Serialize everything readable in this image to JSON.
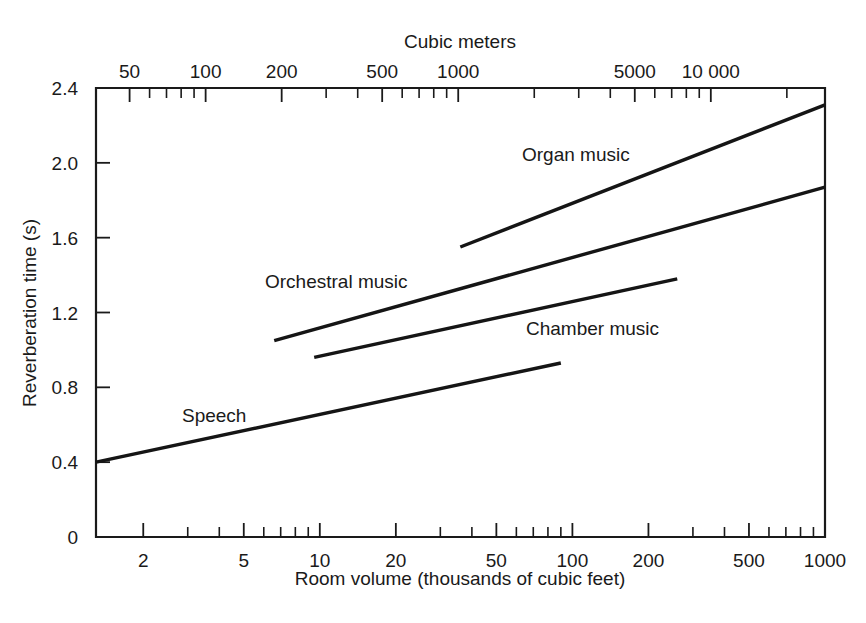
{
  "chart_data": {
    "type": "line",
    "title": "",
    "xlabel": "Room volume (thousands of cubic feet)",
    "ylabel": "Reverberation time (s)",
    "top_axis_label": "Cubic meters",
    "x_scale": "log",
    "y_scale": "linear",
    "xlim": [
      1.3,
      1000
    ],
    "ylim": [
      0,
      2.4
    ],
    "grid": false,
    "legend_position": "inline-labels",
    "x_ticks_major": [
      {
        "value": 2,
        "label": "2"
      },
      {
        "value": 5,
        "label": "5"
      },
      {
        "value": 10,
        "label": "10"
      },
      {
        "value": 20,
        "label": "20"
      },
      {
        "value": 50,
        "label": "50"
      },
      {
        "value": 100,
        "label": "100"
      },
      {
        "value": 200,
        "label": "200"
      },
      {
        "value": 500,
        "label": "500"
      },
      {
        "value": 1000,
        "label": "1000"
      }
    ],
    "x_ticks_minor": [
      3,
      4,
      6,
      7,
      8,
      9,
      30,
      40,
      60,
      70,
      80,
      90,
      300,
      400,
      600,
      700,
      800,
      900
    ],
    "top_ticks_major": [
      {
        "value": 50,
        "label": "50"
      },
      {
        "value": 100,
        "label": "100"
      },
      {
        "value": 200,
        "label": "200"
      },
      {
        "value": 500,
        "label": "500"
      },
      {
        "value": 1000,
        "label": "1000"
      },
      {
        "value": 5000,
        "label": "5000"
      },
      {
        "value": 10000,
        "label": "10 000"
      }
    ],
    "y_ticks": [
      {
        "value": 0,
        "label": "0"
      },
      {
        "value": 0.4,
        "label": "0.4"
      },
      {
        "value": 0.8,
        "label": "0.8"
      },
      {
        "value": 1.2,
        "label": "1.2"
      },
      {
        "value": 1.6,
        "label": "1.6"
      },
      {
        "value": 2.0,
        "label": "2.0"
      },
      {
        "value": 2.4,
        "label": "2.4"
      }
    ],
    "series": [
      {
        "name": "Speech",
        "label": "Speech",
        "points": [
          [
            1.3,
            0.4
          ],
          [
            90,
            0.93
          ]
        ]
      },
      {
        "name": "Chamber music",
        "label": "Chamber music",
        "points": [
          [
            9.5,
            0.96
          ],
          [
            260,
            1.38
          ]
        ]
      },
      {
        "name": "Orchestral music",
        "label": "Orchestral music",
        "points": [
          [
            6.6,
            1.05
          ],
          [
            1000,
            1.87
          ]
        ]
      },
      {
        "name": "Organ music",
        "label": "Organ music",
        "points": [
          [
            36,
            1.55
          ],
          [
            1000,
            2.31
          ]
        ]
      }
    ]
  },
  "series_label_positions": {
    "speech": {
      "x": 182,
      "y": 422
    },
    "orchestral": {
      "x": 265,
      "y": 288
    },
    "chamber": {
      "x": 526,
      "y": 335
    },
    "organ": {
      "x": 522,
      "y": 161
    }
  },
  "colors": {
    "line": "#151515",
    "axis": "#1a1a1a",
    "background": "#ffffff"
  }
}
